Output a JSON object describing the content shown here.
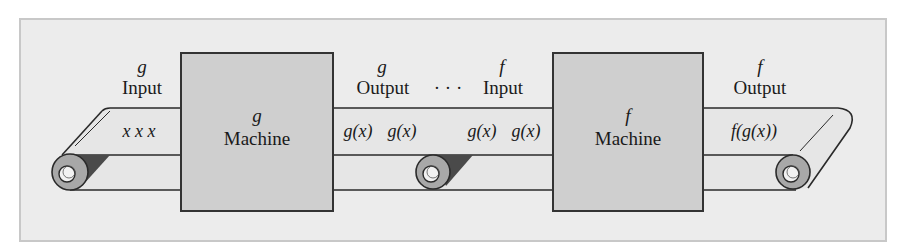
{
  "diagram": {
    "type": "function-composition-conveyor",
    "colors": {
      "frame_bg": "#ececec",
      "frame_border": "#c8c8c8",
      "machine_fill": "#cfcfcf",
      "machine_border": "#333333",
      "belt_fill": "#e6e6e6",
      "line": "#2a2a2a",
      "roller_outer": "#a8a8a8",
      "roller_inner": "#f2f2f2",
      "roller_shadow": "#4a4a4a"
    },
    "g_input": {
      "var": "g",
      "label": "Input",
      "items": "x  x  x"
    },
    "g_machine": {
      "var": "g",
      "label": "Machine"
    },
    "g_output": {
      "var": "g",
      "label": "Output",
      "items": [
        "g(x)",
        "g(x)"
      ]
    },
    "ellipsis": "· · ·",
    "f_input": {
      "var": "f",
      "label": "Input",
      "items": [
        "g(x)",
        "g(x)"
      ]
    },
    "f_machine": {
      "var": "f",
      "label": "Machine"
    },
    "f_output": {
      "var": "f",
      "label": "Output",
      "items": "f(g(x))"
    }
  }
}
